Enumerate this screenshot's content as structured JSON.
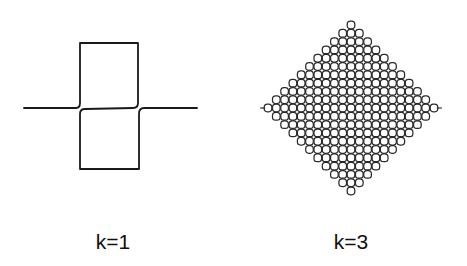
{
  "figures": [
    {
      "id": "k1",
      "label": "k=1",
      "label_pos": {
        "x": 113,
        "y": 230
      },
      "description": "Single-loop configuration: horizontal strand with upper and lower rectangular loops"
    },
    {
      "id": "k3",
      "label": "k=3",
      "label_pos": {
        "x": 351,
        "y": 230
      },
      "description": "Diamond-shaped lattice of interlocking small loops"
    }
  ],
  "style": {
    "stroke": "#1a1a1a",
    "lattice_stroke": "#2a2a2a",
    "background": "#ffffff"
  },
  "geometry": {
    "k1": {
      "line_y": 108,
      "line_x0": 24,
      "line_x1": 197,
      "box_left": 80,
      "box_right": 138,
      "box_top": 43,
      "box_bottom": 169
    },
    "k3": {
      "cx": 351,
      "cy": 108,
      "pitch": 8.3,
      "radius": 10.6
    }
  }
}
